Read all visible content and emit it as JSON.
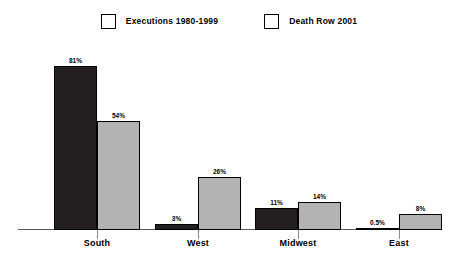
{
  "chart_data": {
    "type": "bar",
    "title": "",
    "xlabel": "",
    "ylabel": "",
    "ylim": [
      0,
      90
    ],
    "grid": false,
    "legend_position": "top-center",
    "categories": [
      "South",
      "West",
      "Midwest",
      "East"
    ],
    "series": [
      {
        "name": "Executions 1980-1999",
        "color": "#231f20",
        "values": [
          81,
          3,
          11,
          0.5
        ],
        "labels": [
          "81%",
          "3%",
          "11%",
          "0.5%"
        ]
      },
      {
        "name": "Death Row 2001",
        "color": "#b3b3b3",
        "values": [
          54,
          26,
          14,
          8
        ],
        "labels": [
          "54%",
          "26%",
          "14%",
          "8%"
        ]
      }
    ]
  },
  "legend": {
    "items": [
      {
        "label": "Executions 1980-1999",
        "color": "#231f20"
      },
      {
        "label": "Death Row 2001",
        "color": "#b3b3b3"
      }
    ]
  },
  "axis": {
    "baseline_color": "#5a5a5a",
    "tick_color": "#8a8a8a"
  }
}
